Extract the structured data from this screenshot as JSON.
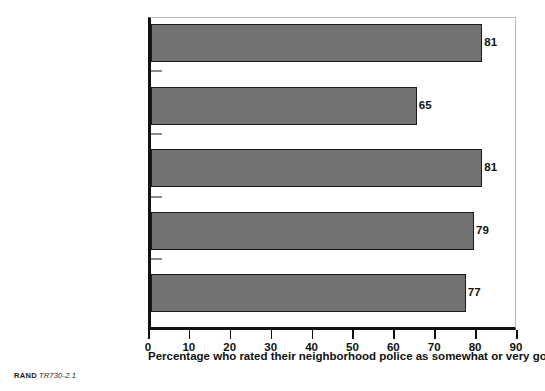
{
  "credit": {
    "brand": "RAND",
    "figure_id": "TR730-2.1"
  },
  "chart_data": {
    "type": "bar",
    "orientation": "horizontal",
    "title": "",
    "subtitle": "",
    "xlabel": "Percentage who rated their neighborhood police as somewhat or very good",
    "ylabel": "",
    "categories": [
      "Crime-fighting skills",
      "Prompt response",
      "Helping victims",
      "Working with residents",
      "Effective against\nproblems"
    ],
    "values": [
      81,
      65,
      81,
      79,
      77
    ],
    "value_labels": [
      "81",
      "65",
      "81",
      "79",
      "77"
    ],
    "xlim": [
      0,
      90
    ],
    "xticks": [
      0,
      10,
      20,
      30,
      40,
      50,
      60,
      70,
      80,
      90
    ],
    "xtick_labels": [
      "0",
      "10",
      "20",
      "30",
      "40",
      "50",
      "60",
      "70",
      "80",
      "90"
    ],
    "grid": false,
    "legend": null,
    "colors": {
      "bar_fill": "#727272",
      "bar_edge": "#1b1b1b",
      "axis": "#111111",
      "frame": "#b9b9b9",
      "text": "#111111",
      "background": "#ffffff"
    }
  }
}
